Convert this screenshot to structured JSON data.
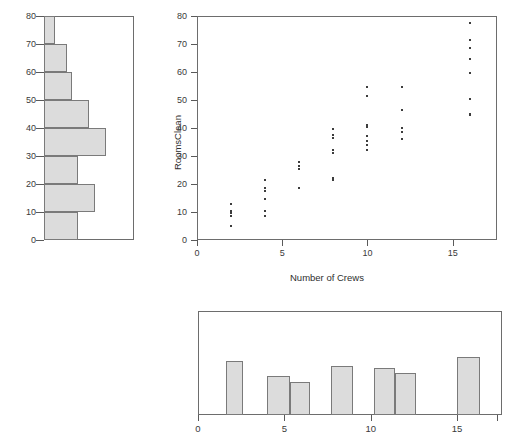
{
  "chart_data": [
    {
      "type": "scatter",
      "name": "rooms-clean-vs-crews",
      "title": "",
      "xlabel": "Number of Crews",
      "ylabel": "RoomsClean",
      "xlim": [
        0,
        17.6
      ],
      "ylim": [
        0,
        80
      ],
      "xticks": [
        0,
        5,
        10,
        15
      ],
      "yticks": [
        0,
        10,
        20,
        30,
        40,
        50,
        60,
        70,
        80
      ],
      "xticklabels": [
        "0",
        "5",
        "10",
        "15"
      ],
      "yticklabels": [
        "0",
        "10",
        "20",
        "30",
        "40",
        "50",
        "60",
        "70",
        "80"
      ],
      "grid": false,
      "legend": false,
      "x": [
        2,
        2,
        2,
        2,
        2,
        4,
        4,
        4,
        4,
        4,
        4,
        6,
        6,
        6,
        6,
        8,
        8,
        8,
        8,
        8,
        8,
        8,
        10,
        10,
        10,
        10,
        10,
        10,
        10,
        10,
        12,
        12,
        12,
        12,
        12,
        16,
        16,
        16,
        16,
        16,
        16,
        16,
        16
      ],
      "y": [
        13.0,
        10.5,
        9.5,
        8.5,
        5.0,
        21.5,
        18.5,
        17.5,
        14.5,
        10.5,
        8.5,
        28.0,
        26.5,
        25.5,
        18.5,
        39.5,
        37.5,
        36.5,
        32.0,
        31.0,
        22.0,
        21.5,
        54.5,
        51.5,
        41.0,
        40.5,
        37.0,
        35.5,
        34.0,
        32.0,
        54.5,
        46.5,
        40.0,
        38.5,
        36.0,
        77.5,
        71.5,
        68.5,
        64.5,
        59.5,
        50.5,
        45.0,
        44.5
      ]
    },
    {
      "type": "bar",
      "name": "rooms-clean-marginal-histogram",
      "orientation": "horizontal",
      "title": "",
      "xlabel": "",
      "ylabel": "",
      "ylim": [
        0,
        80
      ],
      "yticks": [
        0,
        10,
        20,
        30,
        40,
        50,
        60,
        70,
        80
      ],
      "yticklabels": [
        "0",
        "10",
        "20",
        "30",
        "40",
        "50",
        "60",
        "70",
        "80"
      ],
      "grid": false,
      "legend": false,
      "bin_edges": [
        0,
        10,
        20,
        30,
        40,
        50,
        60,
        70,
        80
      ],
      "categories": [
        "0-10",
        "10-20",
        "20-30",
        "30-40",
        "40-50",
        "50-60",
        "60-70",
        "70-80"
      ],
      "values": [
        6,
        9,
        6,
        11,
        8,
        5,
        4,
        2
      ]
    },
    {
      "type": "bar",
      "name": "number-of-crews-marginal-histogram",
      "orientation": "vertical",
      "title": "",
      "xlabel": "",
      "ylabel": "",
      "xlim": [
        0,
        17.6
      ],
      "xticks": [
        0,
        5,
        10,
        15
      ],
      "xticklabels": [
        "0",
        "5",
        "10",
        "15"
      ],
      "grid": false,
      "legend": false,
      "bin_edges": [
        1.5,
        2.5,
        4.0,
        5.3,
        6.3,
        7.7,
        9.0,
        10.2,
        11.4,
        12.6,
        15.2,
        16.4
      ],
      "categories": [
        "2",
        "4",
        "5",
        "6",
        "8",
        "10",
        "11",
        "12",
        "16"
      ],
      "bars": [
        {
          "x0": 1.6,
          "x1": 2.6,
          "height": 5
        },
        {
          "x0": 4.0,
          "x1": 5.3,
          "height": 3.6
        },
        {
          "x0": 5.3,
          "x1": 6.5,
          "height": 3.1
        },
        {
          "x0": 7.7,
          "x1": 9.0,
          "height": 4.6
        },
        {
          "x0": 10.2,
          "x1": 11.4,
          "height": 4.4
        },
        {
          "x0": 11.4,
          "x1": 12.6,
          "height": 3.9
        },
        {
          "x0": 15.0,
          "x1": 16.3,
          "height": 5.4
        }
      ]
    }
  ],
  "left_panel": {
    "tick_labels": [
      "80",
      "70",
      "60",
      "50",
      "40",
      "30",
      "20",
      "10",
      "0"
    ]
  },
  "scatter_panel": {
    "y_axis_title": "RoomsClean",
    "x_axis_title": "Number of Crews",
    "y_tick_labels": [
      "80",
      "70",
      "60",
      "50",
      "40",
      "30",
      "20",
      "10",
      "0"
    ],
    "x_tick_labels": [
      "0",
      "5",
      "10",
      "15"
    ]
  },
  "bottom_panel": {
    "x_tick_labels": [
      "0",
      "5",
      "10",
      "15"
    ]
  }
}
